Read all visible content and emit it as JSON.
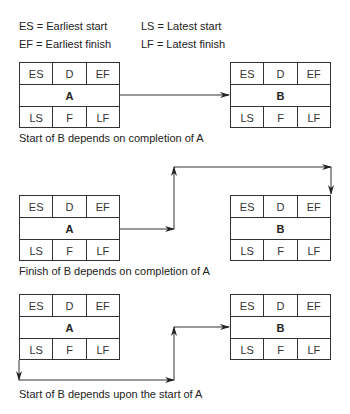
{
  "legend": {
    "es": "ES = Earliest start",
    "ls": "LS = Latest start",
    "ef": "EF = Earliest finish",
    "lf": "LF = Latest finish"
  },
  "cells": {
    "es": "ES",
    "d": "D",
    "ef": "EF",
    "ls": "LS",
    "f": "F",
    "lf": "LF"
  },
  "diagrams": [
    {
      "from": "A",
      "to": "B",
      "caption": "Start of B depends on completion of A"
    },
    {
      "from": "A",
      "to": "B",
      "caption": "Finish of B depends on completion of A"
    },
    {
      "from": "A",
      "to": "B",
      "caption": "Start of B depends upon the start of A"
    }
  ],
  "colors": {
    "line": "#333333",
    "text": "#222222",
    "background": "#ffffff"
  }
}
